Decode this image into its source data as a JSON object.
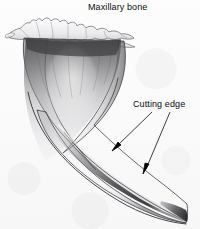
{
  "figure": {
    "title": "Maxillary bone",
    "width": 200,
    "height": 229,
    "background_color": "#fbfbfb",
    "ink_color": "#1a1a1a"
  },
  "labels": {
    "maxillary_bone": "Maxillary bone",
    "cutting_edge": "Cutting edge"
  },
  "leaders": [
    {
      "name": "leader-upper",
      "from_x": 152,
      "from_y": 112,
      "to_x": 113,
      "to_y": 150
    },
    {
      "name": "leader-lower",
      "from_x": 170,
      "from_y": 112,
      "to_x": 143,
      "to_y": 172
    }
  ],
  "anatomy": {
    "bone_fragment_label": "maxillary bone fragment",
    "root_collar_label": "root collar shading",
    "tooth_body_label": "curved tooth body",
    "cutting_edge_ridge_label": "cutting edge ridge",
    "tip_label": "tooth tip"
  }
}
